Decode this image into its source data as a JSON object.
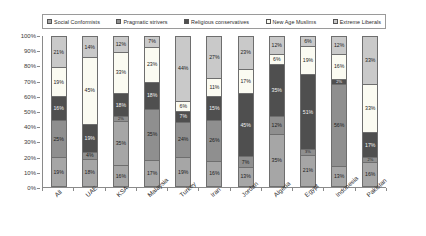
{
  "legend": {
    "items": [
      {
        "label": "Social Conformists",
        "color": "#a6a6a6"
      },
      {
        "label": "Pragmatic strivers",
        "color": "#8f8f8f"
      },
      {
        "label": "Religious conservatives",
        "color": "#4f4f4f"
      },
      {
        "label": "New Age Muslims",
        "color": "#fbfbf2"
      },
      {
        "label": "Extreme Liberals",
        "color": "#c9c9c9"
      }
    ]
  },
  "axes": {
    "y_ticks": [
      "100%",
      "90%",
      "80%",
      "70%",
      "60%",
      "50%",
      "40%",
      "30%",
      "20%",
      "10%",
      "0%"
    ],
    "y_min": 0,
    "y_max": 100
  },
  "chart_data": {
    "type": "bar",
    "stacked": true,
    "title": "",
    "xlabel": "",
    "ylabel": "",
    "ylim": [
      0,
      100
    ],
    "grid": false,
    "legend_position": "top",
    "categories": [
      "All",
      "UAE",
      "KSA",
      "Malaysia",
      "Turkey",
      "Iran",
      "Jordan",
      "Algeria",
      "Egypt",
      "Indonesia",
      "Pakistan"
    ],
    "series": [
      {
        "name": "Social Conformists",
        "color": "#a6a6a6",
        "values": [
          19,
          18,
          16,
          17,
          19,
          16,
          13,
          35,
          21,
          13,
          16
        ]
      },
      {
        "name": "Pragmatic strivers",
        "color": "#8f8f8f",
        "values": [
          25,
          4,
          35,
          35,
          24,
          26,
          7,
          12,
          3,
          56,
          2
        ]
      },
      {
        "name": "Religious conservatives",
        "color": "#4f4f4f",
        "values": [
          16,
          19,
          2,
          18,
          7,
          15,
          45,
          35,
          51,
          2,
          17
        ]
      },
      {
        "name": "New Age Muslims",
        "color": "#fbfbf2",
        "values": [
          19,
          45,
          33,
          23,
          6,
          11,
          17,
          6,
          19,
          16,
          33
        ]
      },
      {
        "name": "Extreme Liberals",
        "color": "#c9c9c9",
        "values": [
          21,
          14,
          12,
          7,
          44,
          27,
          23,
          12,
          6,
          12,
          33
        ]
      }
    ],
    "bars": [
      {
        "category": "All",
        "segments": [
          {
            "series": "Extreme Liberals",
            "value": 21,
            "label": "21%"
          },
          {
            "series": "New Age Muslims",
            "value": 19,
            "label": "19%"
          },
          {
            "series": "Religious conservatives",
            "value": 16,
            "label": "16%"
          },
          {
            "series": "Pragmatic strivers",
            "value": 25,
            "label": "25%"
          },
          {
            "series": "Social Conformists",
            "value": 19,
            "label": "19%"
          }
        ]
      },
      {
        "category": "UAE",
        "segments": [
          {
            "series": "Extreme Liberals",
            "value": 14,
            "label": "14%"
          },
          {
            "series": "New Age Muslims",
            "value": 45,
            "label": "45%"
          },
          {
            "series": "Religious conservatives",
            "value": 19,
            "label": "19%"
          },
          {
            "series": "Pragmatic strivers",
            "value": 4,
            "label": "4%"
          },
          {
            "series": "Social Conformists",
            "value": 18,
            "label": "18%"
          }
        ]
      },
      {
        "category": "KSA",
        "segments": [
          {
            "series": "Extreme Liberals",
            "value": 12,
            "label": "12%"
          },
          {
            "series": "New Age Muslims",
            "value": 33,
            "label": "33%"
          },
          {
            "series": "Religious conservatives",
            "value": 18,
            "label": "18%"
          },
          {
            "series": "Pragmatic strivers",
            "value": 2,
            "label": "2%"
          },
          {
            "series": "Social Conformists",
            "value": 35,
            "label": "35%"
          },
          {
            "series": "Social Conformists",
            "value": 16,
            "label": "16%"
          }
        ]
      },
      {
        "category": "Malaysia",
        "segments": [
          {
            "series": "Extreme Liberals",
            "value": 7,
            "label": "7%"
          },
          {
            "series": "New Age Muslims",
            "value": 23,
            "label": "23%"
          },
          {
            "series": "Religious conservatives",
            "value": 18,
            "label": "18%"
          },
          {
            "series": "Pragmatic strivers",
            "value": 35,
            "label": "35%"
          },
          {
            "series": "Social Conformists",
            "value": 17,
            "label": "17%"
          }
        ]
      },
      {
        "category": "Turkey",
        "segments": [
          {
            "series": "Extreme Liberals",
            "value": 44,
            "label": "44%"
          },
          {
            "series": "New Age Muslims",
            "value": 6,
            "label": "6%"
          },
          {
            "series": "Religious conservatives",
            "value": 7,
            "label": "7%"
          },
          {
            "series": "Pragmatic strivers",
            "value": 24,
            "label": "24%"
          },
          {
            "series": "Social Conformists",
            "value": 19,
            "label": "19%"
          }
        ]
      },
      {
        "category": "Iran",
        "segments": [
          {
            "series": "Extreme Liberals",
            "value": 27,
            "label": "27%"
          },
          {
            "series": "New Age Muslims",
            "value": 11,
            "label": "11%"
          },
          {
            "series": "Religious conservatives",
            "value": 15,
            "label": "15%"
          },
          {
            "series": "Pragmatic strivers",
            "value": 26,
            "label": "26%"
          },
          {
            "series": "Social Conformists",
            "value": 16,
            "label": "16%"
          }
        ]
      },
      {
        "category": "Jordan",
        "segments": [
          {
            "series": "Extreme Liberals",
            "value": 23,
            "label": "23%"
          },
          {
            "series": "New Age Muslims",
            "value": 17,
            "label": "17%"
          },
          {
            "series": "Religious conservatives",
            "value": 45,
            "label": "45%"
          },
          {
            "series": "Pragmatic strivers",
            "value": 7,
            "label": "7%"
          },
          {
            "series": "Social Conformists",
            "value": 13,
            "label": "13%"
          }
        ]
      },
      {
        "category": "Algeria",
        "segments": [
          {
            "series": "Extreme Liberals",
            "value": 12,
            "label": "12%"
          },
          {
            "series": "New Age Muslims",
            "value": 6,
            "label": "6%"
          },
          {
            "series": "Religious conservatives",
            "value": 35,
            "label": "35%"
          },
          {
            "series": "Pragmatic strivers",
            "value": 12,
            "label": "12%"
          },
          {
            "series": "Social Conformists",
            "value": 35,
            "label": "35%"
          }
        ]
      },
      {
        "category": "Egypt",
        "segments": [
          {
            "series": "Extreme Liberals",
            "value": 6,
            "label": "6%"
          },
          {
            "series": "New Age Muslims",
            "value": 19,
            "label": "19%"
          },
          {
            "series": "Religious conservatives",
            "value": 51,
            "label": "51%"
          },
          {
            "series": "Pragmatic strivers",
            "value": 3,
            "label": "3%"
          },
          {
            "series": "Social Conformists",
            "value": 21,
            "label": "21%"
          }
        ]
      },
      {
        "category": "Indonesia",
        "segments": [
          {
            "series": "Extreme Liberals",
            "value": 12,
            "label": "12%"
          },
          {
            "series": "New Age Muslims",
            "value": 16,
            "label": "16%"
          },
          {
            "series": "Religious conservatives",
            "value": 2,
            "label": "2%"
          },
          {
            "series": "Pragmatic strivers",
            "value": 56,
            "label": "56%"
          },
          {
            "series": "Social Conformists",
            "value": 13,
            "label": "13%"
          }
        ]
      },
      {
        "category": "Pakistan",
        "segments": [
          {
            "series": "Extreme Liberals",
            "value": 33,
            "label": "33%"
          },
          {
            "series": "New Age Muslims",
            "value": 33,
            "label": "33%"
          },
          {
            "series": "Religious conservatives",
            "value": 17,
            "label": "17%"
          },
          {
            "series": "Pragmatic strivers",
            "value": 2,
            "label": "2%"
          },
          {
            "series": "Social Conformists",
            "value": 16,
            "label": "16%"
          }
        ]
      }
    ]
  }
}
